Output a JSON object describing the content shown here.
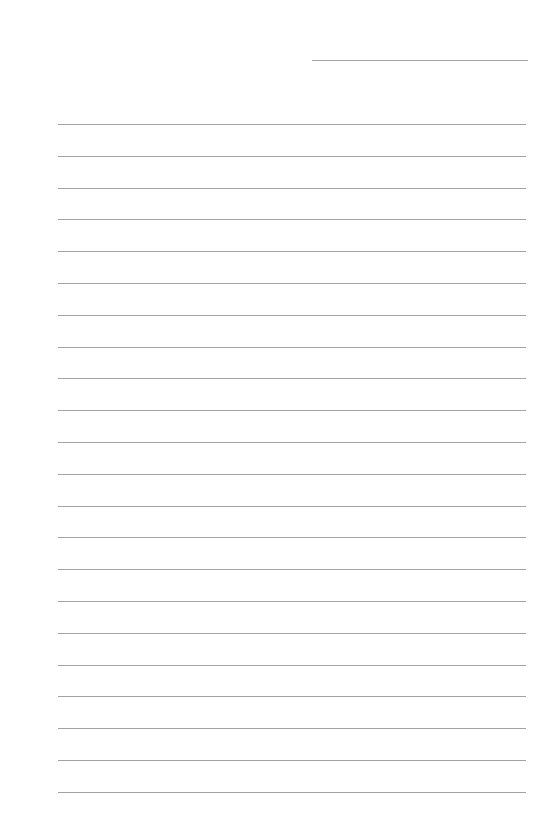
{
  "page": {
    "type": "ruled-notebook-page",
    "line_color": "#a3a3a3",
    "header_line": {
      "x": 312,
      "y": 60,
      "width": 216
    },
    "ruled_lines": {
      "count": 22,
      "first_y": 124,
      "spacing": 31.8,
      "x": 58,
      "width": 468
    }
  }
}
